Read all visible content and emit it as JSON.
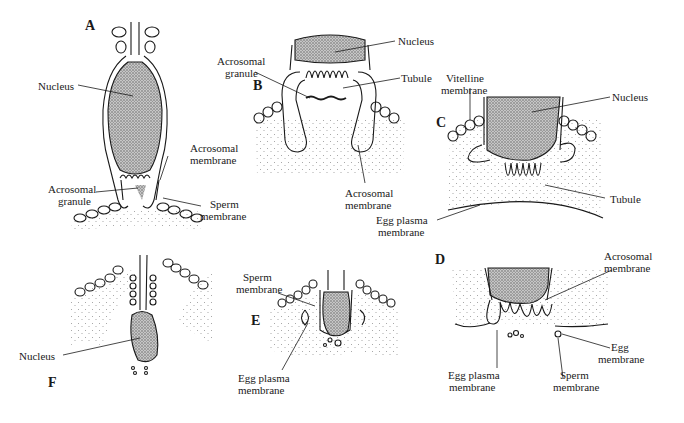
{
  "figure": {
    "type": "biological diagram",
    "background": "#ffffff",
    "ink_color": "#1a1a1a",
    "stipple_color": "#9a9a9a"
  },
  "panels": {
    "A": {
      "letter": "A",
      "labels": {
        "nucleus": "Nucleus",
        "acrosomal_membrane_1": "Acrosomal",
        "acrosomal_membrane_2": "membrane",
        "acrosomal_granule_1": "Acrosomal",
        "acrosomal_granule_2": "granule",
        "sperm_membrane_1": "Sperm",
        "sperm_membrane_2": "membrane"
      }
    },
    "B": {
      "letter": "B",
      "labels": {
        "nucleus": "Nucleus",
        "acrosomal_granule_1": "Acrosomal",
        "acrosomal_granule_2": "granule",
        "tubule": "Tubule",
        "acrosomal_membrane_1": "Acrosomal",
        "acrosomal_membrane_2": "membrane"
      }
    },
    "C": {
      "letter": "C",
      "labels": {
        "vitelline_membrane_1": "Vitelline",
        "vitelline_membrane_2": "membrane",
        "nucleus": "Nucleus",
        "tubule": "Tubule",
        "egg_plasma_membrane_1": "Egg plasma",
        "egg_plasma_membrane_2": "membrane"
      }
    },
    "D": {
      "letter": "D",
      "labels": {
        "acrosomal_membrane_1": "Acrosomal",
        "acrosomal_membrane_2": "membrane",
        "egg_plasma_membrane_1": "Egg plasma",
        "egg_plasma_membrane_2": "membrane",
        "sperm_membrane_1": "Sperm",
        "sperm_membrane_2": "membrane",
        "egg_membrane_1": "Egg",
        "egg_membrane_2": "membrane"
      }
    },
    "E": {
      "letter": "E",
      "labels": {
        "sperm_membrane_1": "Sperm",
        "sperm_membrane_2": "membrane",
        "egg_plasma_membrane_1": "Egg plasma",
        "egg_plasma_membrane_2": "membrane"
      }
    },
    "F": {
      "letter": "F",
      "labels": {
        "nucleus": "Nucleus"
      }
    }
  }
}
